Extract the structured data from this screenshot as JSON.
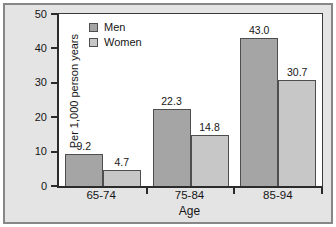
{
  "chart_data": {
    "type": "bar",
    "title": "",
    "categories": [
      "65-74",
      "75-84",
      "85-94"
    ],
    "series": [
      {
        "name": "Men",
        "color": "#a5a5a5",
        "values": [
          9.2,
          22.3,
          43.0
        ]
      },
      {
        "name": "Women",
        "color": "#c7c7c7",
        "values": [
          4.7,
          14.8,
          30.7
        ]
      }
    ],
    "xlabel": "Age",
    "ylabel": "Per 1,000 person years",
    "ylim": [
      0,
      50
    ],
    "yticks": [
      0,
      10,
      20,
      30,
      40,
      50
    ],
    "grid": false,
    "legend_position": "top-left",
    "value_label_decimals": 1
  },
  "style_colors": {
    "figure_background": "#e4e4e4",
    "figure_border": "#878787",
    "plot_background": "#ffffff",
    "axis": "#2b2b2b",
    "bar_border": "#4e4e4e",
    "text": "#161616"
  }
}
